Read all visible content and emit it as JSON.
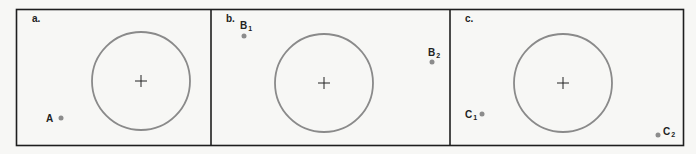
{
  "colors": {
    "frame": "#1e1e1e",
    "circle": "#8a8a8a",
    "point": "#8c8c8c",
    "background": "#f7f7f5"
  },
  "panels": [
    {
      "label": "a.",
      "circle": {
        "cx": 141,
        "cy": 81,
        "r": 49
      },
      "points": [
        {
          "name": "A",
          "sub": "",
          "x": 61,
          "y": 118,
          "lx": 46,
          "ly": 122
        }
      ]
    },
    {
      "label": "b.",
      "circle": {
        "cx": 324,
        "cy": 83,
        "r": 49
      },
      "points": [
        {
          "name": "B",
          "sub": "1",
          "x": 244,
          "y": 36,
          "lx": 240,
          "ly": 29
        },
        {
          "name": "B",
          "sub": "2",
          "x": 432,
          "y": 62,
          "lx": 428,
          "ly": 56
        }
      ]
    },
    {
      "label": "c.",
      "circle": {
        "cx": 563,
        "cy": 83,
        "r": 49
      },
      "points": [
        {
          "name": "C",
          "sub": "1",
          "x": 482,
          "y": 114,
          "lx": 465,
          "ly": 118
        },
        {
          "name": "C",
          "sub": "2",
          "x": 658,
          "y": 135,
          "lx": 663,
          "ly": 135
        }
      ]
    }
  ]
}
